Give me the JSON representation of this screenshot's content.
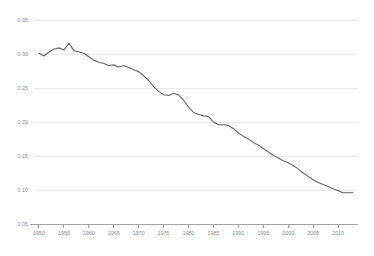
{
  "chart_data": {
    "type": "line",
    "title": "",
    "subtitle": "",
    "xlabel": "",
    "ylabel": "",
    "xlim": [
      1949,
      2014
    ],
    "ylim": [
      0.05,
      0.35
    ],
    "grid": true,
    "legend": false,
    "legend_position": "none",
    "line_color": "#666666",
    "grid_color": "#e9e9e9",
    "axis_color": "#9a9a9a",
    "tick_label_color": "#8c8c8c",
    "y_ticks": [
      0.05,
      0.1,
      0.15,
      0.2,
      0.25,
      0.3,
      0.35
    ],
    "y_tick_labels": [
      "0.05",
      "0.10",
      "0.15",
      "0.20",
      "0.25",
      "0.30",
      "0.35"
    ],
    "x_ticks": [
      1950,
      1955,
      1960,
      1965,
      1970,
      1975,
      1980,
      1985,
      1990,
      1995,
      2000,
      2005,
      2010
    ],
    "x_tick_labels": [
      "1950",
      "1955",
      "1960",
      "1965",
      "1970",
      "1975",
      "1980",
      "1985",
      "1990",
      "1995",
      "2000",
      "2005",
      "2010"
    ],
    "series": [
      {
        "name": "series-1",
        "color": "#666666",
        "x": [
          1950,
          1951,
          1952,
          1953,
          1954,
          1955,
          1956,
          1957,
          1958,
          1959,
          1960,
          1961,
          1962,
          1963,
          1964,
          1965,
          1966,
          1967,
          1968,
          1969,
          1970,
          1971,
          1972,
          1973,
          1974,
          1975,
          1976,
          1977,
          1978,
          1979,
          1980,
          1981,
          1982,
          1983,
          1984,
          1985,
          1986,
          1987,
          1988,
          1989,
          1990,
          1991,
          1992,
          1993,
          1994,
          1995,
          1996,
          1997,
          1998,
          1999,
          2000,
          2001,
          2002,
          2003,
          2004,
          2005,
          2006,
          2007,
          2008,
          2009,
          2010,
          2011,
          2012,
          2013
        ],
        "y": [
          0.301,
          0.297,
          0.303,
          0.307,
          0.309,
          0.306,
          0.316,
          0.305,
          0.303,
          0.301,
          0.296,
          0.291,
          0.288,
          0.286,
          0.283,
          0.284,
          0.281,
          0.283,
          0.28,
          0.277,
          0.274,
          0.268,
          0.261,
          0.252,
          0.245,
          0.24,
          0.239,
          0.242,
          0.24,
          0.232,
          0.222,
          0.214,
          0.211,
          0.209,
          0.208,
          0.2,
          0.196,
          0.196,
          0.195,
          0.19,
          0.184,
          0.179,
          0.175,
          0.17,
          0.166,
          0.161,
          0.156,
          0.151,
          0.147,
          0.143,
          0.14,
          0.136,
          0.131,
          0.125,
          0.12,
          0.115,
          0.111,
          0.108,
          0.105,
          0.102,
          0.099,
          0.096,
          0.096,
          0.096
        ]
      }
    ]
  }
}
